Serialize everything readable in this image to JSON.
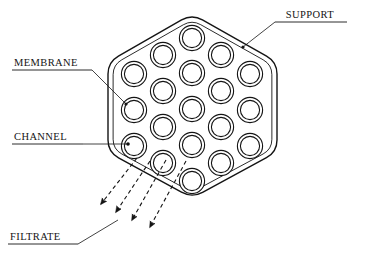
{
  "figure": {
    "type": "technical-diagram",
    "background_color": "#ffffff",
    "line_color": "#141414"
  },
  "labels": [
    {
      "id": "support",
      "text": "SUPPORT",
      "x": 310,
      "y": 18,
      "anchor": "middle",
      "underline": {
        "x1": 275,
        "y1": 22,
        "x2": 347,
        "y2": 22
      },
      "leader": {
        "x1": 275,
        "y1": 22,
        "x2": 243,
        "y2": 47
      },
      "marker_dot": {
        "cx": 243,
        "cy": 47,
        "r": 1.6
      }
    },
    {
      "id": "membrane",
      "text": "MEMBRANE",
      "x": 14,
      "y": 66,
      "anchor": "start",
      "underline": {
        "x1": 12,
        "y1": 70,
        "x2": 92,
        "y2": 70
      },
      "leader": {
        "x1": 92,
        "y1": 70,
        "x2": 126,
        "y2": 104
      },
      "marker_dot": {
        "cx": 126,
        "cy": 104,
        "r": 1.6
      }
    },
    {
      "id": "channel",
      "text": "CHANNEL",
      "x": 14,
      "y": 140,
      "anchor": "start",
      "underline": {
        "x1": 12,
        "y1": 144,
        "x2": 83,
        "y2": 144
      },
      "leader": {
        "x1": 83,
        "y1": 144,
        "x2": 128,
        "y2": 144
      },
      "marker_dot": {
        "cx": 128,
        "cy": 144,
        "r": 1.8
      }
    },
    {
      "id": "filtrate",
      "text": "FILTRATE",
      "x": 10,
      "y": 240,
      "anchor": "start",
      "underline": {
        "x1": 8,
        "y1": 244,
        "x2": 78,
        "y2": 244
      },
      "leader": {
        "x1": 78,
        "y1": 244,
        "x2": 118,
        "y2": 220
      },
      "marker_dot": null
    }
  ],
  "hexagon": {
    "outer_points": "192,14 277,62 277,152 192,198 108,152 108,62",
    "inner_offset": 4,
    "corner_radius": 12,
    "stroke_width": 1.4
  },
  "channels": {
    "count": 19,
    "outer_radius": 12.6,
    "inner_radius": 9.6,
    "stroke_width": 1.1,
    "positions": [
      {
        "cx": 192,
        "cy": 38
      },
      {
        "cx": 163,
        "cy": 55
      },
      {
        "cx": 221,
        "cy": 55
      },
      {
        "cx": 134,
        "cy": 74
      },
      {
        "cx": 192,
        "cy": 73
      },
      {
        "cx": 250,
        "cy": 74
      },
      {
        "cx": 163,
        "cy": 91
      },
      {
        "cx": 221,
        "cy": 91
      },
      {
        "cx": 134,
        "cy": 110
      },
      {
        "cx": 192,
        "cy": 109
      },
      {
        "cx": 250,
        "cy": 110
      },
      {
        "cx": 163,
        "cy": 127
      },
      {
        "cx": 221,
        "cy": 127
      },
      {
        "cx": 134,
        "cy": 146
      },
      {
        "cx": 192,
        "cy": 145
      },
      {
        "cx": 250,
        "cy": 146
      },
      {
        "cx": 163,
        "cy": 163
      },
      {
        "cx": 221,
        "cy": 163
      },
      {
        "cx": 192,
        "cy": 181
      }
    ]
  },
  "filtrate_arrows": {
    "count": 4,
    "style": "dashed",
    "dash_pattern": "4,3",
    "stroke_width": 1.1,
    "arrows": [
      {
        "x1": 137,
        "y1": 158,
        "x2": 101,
        "y2": 204
      },
      {
        "x1": 150,
        "y1": 161,
        "x2": 116,
        "y2": 212
      },
      {
        "x1": 166,
        "y1": 160,
        "x2": 132,
        "y2": 220
      },
      {
        "x1": 186,
        "y1": 161,
        "x2": 150,
        "y2": 227
      }
    ]
  }
}
